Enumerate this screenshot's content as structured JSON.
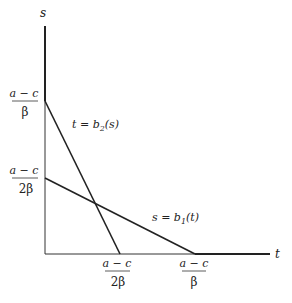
{
  "diagram": {
    "axes": {
      "x_label": "t",
      "y_label": "s"
    },
    "y_ticks": [
      {
        "num": "a − c",
        "den": "β"
      },
      {
        "num": "a − c",
        "den": "2β"
      }
    ],
    "x_ticks": [
      {
        "num": "a − c",
        "den": "2β"
      },
      {
        "num": "a − c",
        "den": "β"
      }
    ],
    "curves": [
      {
        "name": "b2",
        "label_pre": "t = b",
        "sub": "2",
        "label_post": "(s)"
      },
      {
        "name": "b1",
        "label_pre": "s = b",
        "sub": "1",
        "label_post": "(t)"
      }
    ],
    "colors": {
      "line": "#222222",
      "axis": "#444444"
    }
  }
}
